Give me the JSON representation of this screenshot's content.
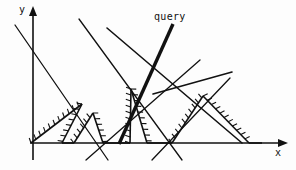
{
  "figure": {
    "title": "query",
    "background_color": "#fdfdfd",
    "ink_color": "#111111",
    "width": 296,
    "height": 170
  },
  "axes": {
    "x_label": "x",
    "y_label": "y",
    "x_axis": {
      "x1": 30,
      "y1": 143,
      "x2": 281,
      "y2": 143,
      "arrow": "right"
    },
    "y_axis": {
      "x1": 33,
      "y1": 160,
      "x2": 33,
      "y2": 13,
      "arrow": "up"
    },
    "stroke_width": 1.6
  },
  "labels": {
    "query": "query",
    "x": "x",
    "y": "y"
  },
  "chart_data": {
    "type": "line",
    "title": "query",
    "xlabel": "x",
    "ylabel": "y",
    "grid": false,
    "legend": "none",
    "xlim": [
      0,
      296
    ],
    "ylim": [
      0,
      170
    ],
    "lines": [
      {
        "name": "line-1",
        "x1": 15,
        "y1": 25,
        "x2": 108,
        "y2": 160,
        "width": 1.3
      },
      {
        "name": "line-2",
        "x1": 79,
        "y1": 19,
        "x2": 182,
        "y2": 160,
        "width": 1.3
      },
      {
        "name": "line-3",
        "x1": 107,
        "y1": 28,
        "x2": 242,
        "y2": 143,
        "width": 1.6
      },
      {
        "name": "line-4",
        "x1": 153,
        "y1": 94,
        "x2": 232,
        "y2": 72,
        "width": 1.6
      },
      {
        "name": "line-5",
        "x1": 230,
        "y1": 78,
        "x2": 152,
        "y2": 160,
        "width": 1.3
      },
      {
        "name": "line-6",
        "x1": 86,
        "y1": 160,
        "x2": 200,
        "y2": 60,
        "width": 1.3
      }
    ],
    "query_line": {
      "name": "query-line",
      "x1": 173,
      "y1": 24,
      "x2": 119,
      "y2": 144,
      "width": 3.4,
      "label": "query"
    },
    "envelope": {
      "name": "lower-envelope",
      "style": "hatched",
      "hatch_side": "upper",
      "hatch_length": 5,
      "hatch_spacing": 6,
      "stroke_width": 1.6,
      "polyline": [
        [
          31,
          143
        ],
        [
          82,
          104
        ],
        [
          62,
          143
        ],
        [
          74,
          143
        ],
        [
          93,
          113
        ],
        [
          103,
          143
        ],
        [
          130,
          143
        ],
        [
          131,
          89
        ],
        [
          147,
          143
        ],
        [
          172,
          143
        ],
        [
          203,
          96
        ],
        [
          249,
          143
        ],
        [
          262,
          143
        ]
      ],
      "peaks": [
        {
          "x": 82,
          "y": 104
        },
        {
          "x": 93,
          "y": 113
        },
        {
          "x": 131,
          "y": 89
        },
        {
          "x": 203,
          "y": 96
        }
      ]
    }
  }
}
